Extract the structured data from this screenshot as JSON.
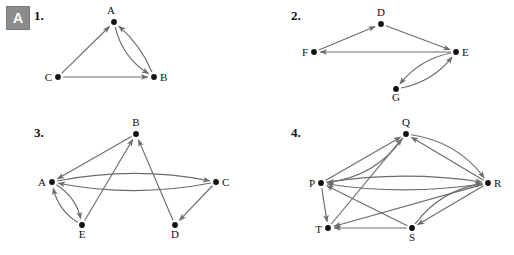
{
  "page": {
    "badge_label": "A",
    "background": "#ffffff",
    "edge_color": "#6b6b70",
    "node_color": "#111111"
  },
  "problems": [
    {
      "number": "1.",
      "number_pos": [
        34,
        8
      ],
      "origin": [
        36,
        4
      ],
      "width": 180,
      "height": 96,
      "nodes": [
        {
          "id": "A",
          "x": 78,
          "y": 18,
          "label": "A",
          "label_dx": -3,
          "label_dy": -8,
          "label_anchor": "middle"
        },
        {
          "id": "B",
          "x": 118,
          "y": 73,
          "label": "B",
          "label_dx": 6,
          "label_dy": 4,
          "label_anchor": "start"
        },
        {
          "id": "C",
          "x": 22,
          "y": 73,
          "label": "C",
          "label_dx": -6,
          "label_dy": 4,
          "label_anchor": "end"
        }
      ],
      "edges": [
        {
          "from": "C",
          "to": "A",
          "curve": 0,
          "arrow": "end"
        },
        {
          "from": "C",
          "to": "B",
          "curve": 0,
          "arrow": "end"
        },
        {
          "from": "A",
          "to": "B",
          "curve": 14,
          "arrow": "end"
        },
        {
          "from": "B",
          "to": "A",
          "curve": 8,
          "arrow": "end"
        }
      ]
    },
    {
      "number": "2.",
      "number_pos": [
        291,
        8
      ],
      "origin": [
        293,
        4
      ],
      "width": 190,
      "height": 100,
      "nodes": [
        {
          "id": "D",
          "x": 88,
          "y": 20,
          "label": "D",
          "label_dx": 0,
          "label_dy": -8,
          "label_anchor": "middle"
        },
        {
          "id": "E",
          "x": 163,
          "y": 48,
          "label": "E",
          "label_dx": 6,
          "label_dy": 4,
          "label_anchor": "start"
        },
        {
          "id": "F",
          "x": 21,
          "y": 48,
          "label": "F",
          "label_dx": -6,
          "label_dy": 4,
          "label_anchor": "end"
        },
        {
          "id": "G",
          "x": 103,
          "y": 85,
          "label": "G",
          "label_dx": 0,
          "label_dy": 12,
          "label_anchor": "middle"
        }
      ],
      "edges": [
        {
          "from": "F",
          "to": "D",
          "curve": 0,
          "arrow": "end"
        },
        {
          "from": "D",
          "to": "E",
          "curve": 0,
          "arrow": "end"
        },
        {
          "from": "E",
          "to": "F",
          "curve": 0,
          "arrow": "end"
        },
        {
          "from": "E",
          "to": "G",
          "curve": 13,
          "arrow": "end"
        },
        {
          "from": "G",
          "to": "E",
          "curve": 13,
          "arrow": "end"
        }
      ]
    },
    {
      "number": "3.",
      "number_pos": [
        34,
        125
      ],
      "origin": [
        30,
        120
      ],
      "width": 205,
      "height": 125,
      "nodes": [
        {
          "id": "B",
          "x": 106,
          "y": 14,
          "label": "B",
          "label_dx": 0,
          "label_dy": -8,
          "label_anchor": "middle"
        },
        {
          "id": "A",
          "x": 22,
          "y": 62,
          "label": "A",
          "label_dx": -6,
          "label_dy": 4,
          "label_anchor": "end"
        },
        {
          "id": "C",
          "x": 186,
          "y": 62,
          "label": "C",
          "label_dx": 6,
          "label_dy": 4,
          "label_anchor": "start"
        },
        {
          "id": "E",
          "x": 52,
          "y": 105,
          "label": "E",
          "label_dx": 0,
          "label_dy": 13,
          "label_anchor": "middle"
        },
        {
          "id": "D",
          "x": 145,
          "y": 105,
          "label": "D",
          "label_dx": 0,
          "label_dy": 13,
          "label_anchor": "middle"
        }
      ],
      "edges": [
        {
          "from": "B",
          "to": "A",
          "curve": 0,
          "arrow": "end"
        },
        {
          "from": "A",
          "to": "C",
          "curve": -16,
          "arrow": "end"
        },
        {
          "from": "C",
          "to": "A",
          "curve": -16,
          "arrow": "end"
        },
        {
          "from": "A",
          "to": "E",
          "curve": -11,
          "arrow": "end"
        },
        {
          "from": "E",
          "to": "A",
          "curve": -11,
          "arrow": "end"
        },
        {
          "from": "E",
          "to": "B",
          "curve": 0,
          "arrow": "end"
        },
        {
          "from": "D",
          "to": "B",
          "curve": 0,
          "arrow": "end"
        },
        {
          "from": "C",
          "to": "D",
          "curve": 0,
          "arrow": "end"
        }
      ]
    },
    {
      "number": "4.",
      "number_pos": [
        291,
        125
      ],
      "origin": [
        288,
        120
      ],
      "width": 215,
      "height": 128,
      "nodes": [
        {
          "id": "Q",
          "x": 118,
          "y": 14,
          "label": "Q",
          "label_dx": 0,
          "label_dy": -8,
          "label_anchor": "middle"
        },
        {
          "id": "P",
          "x": 33,
          "y": 63,
          "label": "P",
          "label_dx": -6,
          "label_dy": 4,
          "label_anchor": "end"
        },
        {
          "id": "R",
          "x": 200,
          "y": 63,
          "label": "R",
          "label_dx": 6,
          "label_dy": 4,
          "label_anchor": "start"
        },
        {
          "id": "T",
          "x": 40,
          "y": 108,
          "label": "T",
          "label_dx": -6,
          "label_dy": 5,
          "label_anchor": "end"
        },
        {
          "id": "S",
          "x": 124,
          "y": 108,
          "label": "S",
          "label_dx": 0,
          "label_dy": 13,
          "label_anchor": "middle"
        }
      ],
      "edges": [
        {
          "from": "Q",
          "to": "P",
          "curve": -22,
          "arrow": "end"
        },
        {
          "from": "P",
          "to": "Q",
          "curve": 0,
          "arrow": "end"
        },
        {
          "from": "Q",
          "to": "R",
          "curve": -20,
          "arrow": "end"
        },
        {
          "from": "R",
          "to": "Q",
          "curve": 0,
          "arrow": "end"
        },
        {
          "from": "P",
          "to": "R",
          "curve": -13,
          "arrow": "end"
        },
        {
          "from": "R",
          "to": "P",
          "curve": -13,
          "arrow": "end"
        },
        {
          "from": "P",
          "to": "T",
          "curve": 0,
          "arrow": "end"
        },
        {
          "from": "S",
          "to": "T",
          "curve": 0,
          "arrow": "end"
        },
        {
          "from": "S",
          "to": "P",
          "curve": 0,
          "arrow": "end"
        },
        {
          "from": "T",
          "to": "Q",
          "curve": 0,
          "arrow": "end"
        },
        {
          "from": "R",
          "to": "S",
          "curve": 0,
          "arrow": "end"
        },
        {
          "from": "S",
          "to": "R",
          "curve": -18,
          "arrow": "end"
        },
        {
          "from": "R",
          "to": "T",
          "curve": 0,
          "arrow": "end"
        }
      ]
    }
  ]
}
